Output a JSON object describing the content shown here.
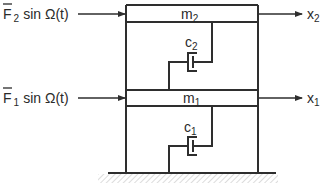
{
  "diagram": {
    "colors": {
      "line": "#2e2e2e",
      "hatch": "#bdbdbd",
      "text": "#2a2a2a",
      "background": "#ffffff"
    },
    "forces": [
      {
        "symbol": "F",
        "bar": true,
        "subscript": "2",
        "expr": "sin Ω(t)"
      },
      {
        "symbol": "F",
        "bar": true,
        "subscript": "1",
        "expr": "sin Ω(t)"
      }
    ],
    "masses": [
      {
        "symbol": "m",
        "subscript": "2"
      },
      {
        "symbol": "m",
        "subscript": "1"
      }
    ],
    "dampers": [
      {
        "symbol": "c",
        "subscript": "2"
      },
      {
        "symbol": "c",
        "subscript": "1"
      }
    ],
    "displacements": [
      {
        "symbol": "x",
        "subscript": "2"
      },
      {
        "symbol": "x",
        "subscript": "1"
      }
    ],
    "ground": {
      "type": "hatched-ground"
    }
  }
}
